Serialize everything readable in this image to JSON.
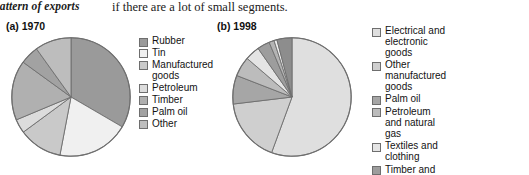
{
  "page": {
    "running_text_left": "pattern of exports",
    "running_text_right": "if there are a lot of small segments."
  },
  "colors": {
    "pie_outline": "#6e6e6e",
    "background": "#ffffff",
    "text": "#131313",
    "shade_dark": "#919191",
    "shade_mid": "#a8a8a8",
    "shade_light": "#c4c4c4",
    "shade_lighter": "#d5d5d5",
    "shade_pale": "#e8e8e8",
    "shade_palest": "#f1f1f1",
    "shade_deep": "#7d7d7d"
  },
  "chart_data": [
    {
      "type": "pie",
      "id": "chart-1970",
      "title": "(a) 1970",
      "xlabel": "",
      "ylabel": "",
      "legend_position": "right",
      "grid": false,
      "categories": [
        "Rubber",
        "Tin",
        "Manufactured\ngoods",
        "Petroleum",
        "Timber",
        "Palm oil",
        "Other"
      ],
      "values": [
        33.4,
        19.6,
        11.9,
        3.8,
        16.3,
        5.1,
        9.9
      ],
      "slice_colors": [
        "#9a9a9a",
        "#f0f0f0",
        "#c9c9c9",
        "#dcdcdc",
        "#b0b0b0",
        "#a2a2a2",
        "#bdbdbd"
      ]
    },
    {
      "type": "pie",
      "id": "chart-1998",
      "title": "(b) 1998",
      "xlabel": "",
      "ylabel": "",
      "legend_position": "right",
      "grid": false,
      "categories": [
        "Electrical and electronic goods",
        "Other manufactured goods",
        "Palm oil",
        "Petroleum and natural gas",
        "Textiles and clothing",
        "Timber and wood products",
        "Rubber",
        "Tin",
        "Other"
      ],
      "values": [
        55.6,
        17.5,
        7.8,
        5.4,
        4.0,
        3.4,
        1.4,
        0.8,
        4.1
      ],
      "slice_colors": [
        "#dfdfdf",
        "#cfcfcf",
        "#a6a6a6",
        "#bcbcbc",
        "#e4e4e4",
        "#9d9d9d",
        "#b4b4b4",
        "#efefef",
        "#8d8d8d"
      ]
    }
  ],
  "legends": {
    "chart_1970": [
      {
        "label": "Rubber",
        "color": "#9a9a9a"
      },
      {
        "label": "Tin",
        "color": "#f0f0f0"
      },
      {
        "label": "Manufactured\ngoods",
        "color": "#c9c9c9"
      },
      {
        "label": "Petroleum",
        "color": "#dcdcdc"
      },
      {
        "label": "Timber",
        "color": "#b0b0b0"
      },
      {
        "label": "Palm oil",
        "color": "#a2a2a2"
      },
      {
        "label": "Other",
        "color": "#bdbdbd"
      }
    ],
    "chart_1998": [
      {
        "label": "Electrical and electronic goods",
        "color": "#dfdfdf"
      },
      {
        "label": "Other manufactured goods",
        "color": "#cfcfcf"
      },
      {
        "label": "Palm oil",
        "color": "#a6a6a6"
      },
      {
        "label": "Petroleum and natural gas",
        "color": "#bcbcbc"
      },
      {
        "label": "Textiles and clothing",
        "color": "#e4e4e4"
      },
      {
        "label": "Timber and wood products",
        "color": "#9d9d9d"
      },
      {
        "label": "Rubber",
        "color": "#b4b4b4"
      },
      {
        "label": "Tin",
        "color": "#efefef"
      },
      {
        "label": "Other",
        "color": "#8d8d8d"
      }
    ]
  }
}
